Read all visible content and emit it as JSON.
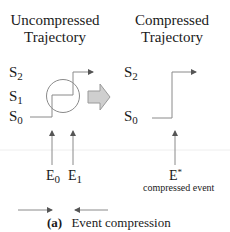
{
  "left_panel": {
    "title_line1": "Uncompressed",
    "title_line2": "Trajectory",
    "states": [
      {
        "base": "S",
        "sub": "2"
      },
      {
        "base": "S",
        "sub": "1"
      },
      {
        "base": "S",
        "sub": "0"
      }
    ],
    "events": [
      {
        "base": "E",
        "sub": "0"
      },
      {
        "base": "E",
        "sub": "1"
      }
    ]
  },
  "right_panel": {
    "title_line1": "Compressed",
    "title_line2": "Trajectory",
    "states": [
      {
        "base": "S",
        "sub": "2"
      },
      {
        "base": "S",
        "sub": "0"
      }
    ],
    "event": {
      "base": "E",
      "sup": "*"
    },
    "event_note": "compressed event"
  },
  "caption": {
    "label": "(a)",
    "text": "Event compression"
  },
  "colors": {
    "line": "#8a8a8a",
    "arrow_fill": "#cfcfcf",
    "arrow_stroke": "#9a9a9a",
    "text": "#1a1a1a"
  }
}
